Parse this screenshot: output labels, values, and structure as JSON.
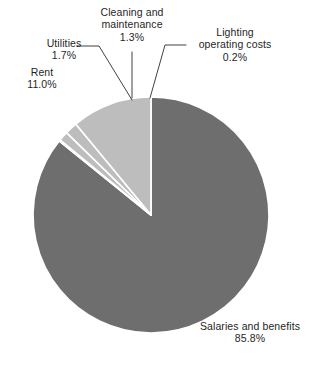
{
  "chart_data": {
    "type": "pie",
    "title": "",
    "subtitle": "",
    "xlabel": "",
    "ylabel": "",
    "legend_position": "none",
    "grid": false,
    "units": "percent",
    "categories": [
      "Salaries and benefits",
      "Lighting operating costs",
      "Cleaning and maintenance",
      "Utilities",
      "Rent"
    ],
    "values": [
      85.8,
      0.2,
      1.3,
      1.7,
      11.0
    ],
    "slices": [
      {
        "label": "Salaries and benefits",
        "value": 85.8,
        "value_text": "85.8%",
        "color": "#6e6e6e",
        "start_angle_deg": 0.0,
        "end_angle_deg": 308.88
      },
      {
        "label": "Lighting operating costs",
        "value": 0.2,
        "value_text": "0.2%",
        "color": "#bdbdbd",
        "start_angle_deg": 308.88,
        "end_angle_deg": 309.6
      },
      {
        "label": "Cleaning and maintenance",
        "value": 1.3,
        "value_text": "1.3%",
        "color": "#bdbdbd",
        "start_angle_deg": 309.6,
        "end_angle_deg": 314.28
      },
      {
        "label": "Utilities",
        "value": 1.7,
        "value_text": "1.7%",
        "color": "#bdbdbd",
        "start_angle_deg": 314.28,
        "end_angle_deg": 320.4
      },
      {
        "label": "Rent",
        "value": 11.0,
        "value_text": "11.0%",
        "color": "#bdbdbd",
        "start_angle_deg": 320.4,
        "end_angle_deg": 360.0
      }
    ]
  },
  "labels": {
    "cleaning": {
      "line1": "Cleaning and",
      "line2": "maintenance",
      "percent": "1.3%"
    },
    "lighting": {
      "line1": "Lighting",
      "line2": "operating costs",
      "percent": "0.2%"
    },
    "utilities": {
      "line1": "Utilities",
      "percent": "1.7%"
    },
    "rent": {
      "line1": "Rent",
      "percent": "11.0%"
    },
    "salaries": {
      "line1": "Salaries and benefits",
      "percent": "85.8%"
    }
  },
  "colors": {
    "major_slice": "#6e6e6e",
    "minor_slice": "#bdbdbd",
    "separator": "#ffffff",
    "leader_line": "#2b2b2b",
    "background": "#ffffff",
    "text": "#1f1f1f"
  }
}
